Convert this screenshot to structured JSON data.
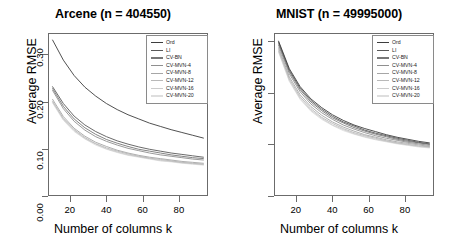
{
  "figure": {
    "background": "#ffffff",
    "panel_count": 2
  },
  "chart_data": [
    {
      "type": "line",
      "title": "Arcene (n = 404550)",
      "xlabel": "Number of columns k",
      "ylabel": "Average RMSE",
      "xlim": [
        8,
        96
      ],
      "ylim": [
        0.0,
        0.345
      ],
      "xticks": [
        20,
        40,
        60,
        80
      ],
      "yticks": [
        0.0,
        0.1,
        0.2,
        0.3
      ],
      "ytick_labels": [
        "0.00",
        "0.10",
        "0.20",
        "0.30"
      ],
      "xtick_labels": [
        "20",
        "40",
        "60",
        "80"
      ],
      "grid": false,
      "legend_position": "top-right",
      "x": [
        10,
        16,
        22,
        28,
        34,
        40,
        46,
        52,
        58,
        64,
        70,
        76,
        82,
        88,
        94
      ],
      "series": [
        {
          "name": "Ord",
          "color": "#3d3d3d",
          "values": [
            0.332,
            0.289,
            0.256,
            0.231,
            0.212,
            0.196,
            0.183,
            0.172,
            0.163,
            0.154,
            0.147,
            0.14,
            0.134,
            0.128,
            0.122
          ]
        },
        {
          "name": "LI",
          "color": "#595959",
          "values": [
            0.232,
            0.196,
            0.169,
            0.15,
            0.136,
            0.125,
            0.116,
            0.109,
            0.103,
            0.098,
            0.094,
            0.09,
            0.087,
            0.084,
            0.081
          ]
        },
        {
          "name": "CV-BN",
          "color": "#777777",
          "values": [
            0.228,
            0.19,
            0.163,
            0.144,
            0.13,
            0.119,
            0.111,
            0.104,
            0.098,
            0.094,
            0.09,
            0.086,
            0.083,
            0.08,
            0.078
          ]
        },
        {
          "name": "CV-MVN-4",
          "color": "#8f8f8f",
          "values": [
            0.224,
            0.185,
            0.158,
            0.139,
            0.125,
            0.115,
            0.107,
            0.1,
            0.095,
            0.09,
            0.086,
            0.083,
            0.08,
            0.077,
            0.075
          ]
        },
        {
          "name": "CV-MVN-8",
          "color": "#a6a6a6",
          "values": [
            0.205,
            0.168,
            0.143,
            0.126,
            0.113,
            0.104,
            0.096,
            0.09,
            0.085,
            0.081,
            0.078,
            0.075,
            0.072,
            0.07,
            0.068
          ]
        },
        {
          "name": "CV-MVN-12",
          "color": "#b9b9b9",
          "values": [
            0.201,
            0.164,
            0.14,
            0.123,
            0.11,
            0.101,
            0.094,
            0.088,
            0.083,
            0.079,
            0.076,
            0.073,
            0.07,
            0.068,
            0.066
          ]
        },
        {
          "name": "CV-MVN-16",
          "color": "#cccccc",
          "values": [
            0.199,
            0.162,
            0.138,
            0.121,
            0.109,
            0.099,
            0.092,
            0.086,
            0.082,
            0.078,
            0.074,
            0.072,
            0.069,
            0.067,
            0.065
          ]
        },
        {
          "name": "CV-MVN-20",
          "color": "#dedede",
          "values": [
            0.197,
            0.16,
            0.136,
            0.12,
            0.107,
            0.098,
            0.091,
            0.085,
            0.081,
            0.077,
            0.073,
            0.071,
            0.068,
            0.066,
            0.064
          ]
        }
      ]
    },
    {
      "type": "line",
      "title": "MNIST (n = 49995000)",
      "xlabel": "Number of columns k",
      "ylabel": "Average RMSE",
      "xlim": [
        8,
        96
      ],
      "ylim": [
        0.0,
        0.315
      ],
      "xticks": [
        20,
        40,
        60,
        80
      ],
      "yticks": [
        0.0,
        0.1,
        0.2,
        0.3
      ],
      "ytick_labels": [
        "0.00",
        "0.10",
        "0.20",
        "0.30"
      ],
      "xtick_labels": [
        "20",
        "40",
        "60",
        "80"
      ],
      "grid": false,
      "legend_position": "top-right",
      "x": [
        10,
        16,
        22,
        28,
        34,
        40,
        46,
        52,
        58,
        64,
        70,
        76,
        82,
        88,
        94
      ],
      "series": [
        {
          "name": "Ord",
          "color": "#3d3d3d",
          "values": [
            0.301,
            0.247,
            0.212,
            0.188,
            0.171,
            0.157,
            0.146,
            0.137,
            0.13,
            0.124,
            0.118,
            0.113,
            0.109,
            0.105,
            0.102
          ]
        },
        {
          "name": "LI",
          "color": "#595959",
          "values": [
            0.299,
            0.244,
            0.209,
            0.185,
            0.168,
            0.154,
            0.143,
            0.135,
            0.127,
            0.121,
            0.116,
            0.111,
            0.107,
            0.103,
            0.1
          ]
        },
        {
          "name": "CV-BN",
          "color": "#777777",
          "values": [
            0.296,
            0.241,
            0.206,
            0.182,
            0.165,
            0.151,
            0.141,
            0.132,
            0.125,
            0.119,
            0.114,
            0.109,
            0.105,
            0.102,
            0.099
          ]
        },
        {
          "name": "CV-MVN-4",
          "color": "#8f8f8f",
          "values": [
            0.293,
            0.237,
            0.202,
            0.178,
            0.161,
            0.148,
            0.137,
            0.129,
            0.122,
            0.116,
            0.111,
            0.107,
            0.103,
            0.1,
            0.097
          ]
        },
        {
          "name": "CV-MVN-8",
          "color": "#a6a6a6",
          "values": [
            0.288,
            0.231,
            0.196,
            0.173,
            0.156,
            0.143,
            0.133,
            0.125,
            0.118,
            0.113,
            0.108,
            0.104,
            0.101,
            0.098,
            0.095
          ]
        },
        {
          "name": "CV-MVN-12",
          "color": "#b9b9b9",
          "values": [
            0.284,
            0.227,
            0.192,
            0.169,
            0.152,
            0.14,
            0.13,
            0.122,
            0.116,
            0.111,
            0.106,
            0.102,
            0.099,
            0.096,
            0.094
          ]
        },
        {
          "name": "CV-MVN-16",
          "color": "#cccccc",
          "values": [
            0.281,
            0.224,
            0.189,
            0.166,
            0.15,
            0.137,
            0.128,
            0.12,
            0.114,
            0.109,
            0.105,
            0.101,
            0.098,
            0.095,
            0.093
          ]
        },
        {
          "name": "CV-MVN-20",
          "color": "#dedede",
          "values": [
            0.279,
            0.222,
            0.187,
            0.164,
            0.148,
            0.136,
            0.126,
            0.119,
            0.113,
            0.108,
            0.104,
            0.1,
            0.097,
            0.094,
            0.092
          ]
        }
      ]
    }
  ]
}
